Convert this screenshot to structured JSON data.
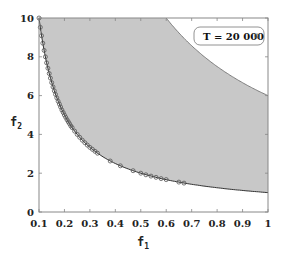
{
  "chart_data": {
    "type": "area",
    "title": "",
    "xlabel": "f",
    "xlabel_sub": "1",
    "ylabel": "f",
    "ylabel_sub": "2",
    "xlim": [
      0.1,
      1.0
    ],
    "ylim": [
      0,
      10
    ],
    "x_ticks": [
      "0.1",
      "0.2",
      "0.3",
      "0.4",
      "0.5",
      "0.6",
      "0.7",
      "0.8",
      "0.9",
      "1"
    ],
    "y_ticks": [
      "0",
      "2",
      "4",
      "6",
      "8",
      "10"
    ],
    "grid": false,
    "legend_position": "upper right",
    "shaded_region": {
      "description": "feasible region between lower and upper bound curves",
      "fill_color": "#c8c8c8",
      "lower_curve": {
        "formula": "f2 = 1/f1",
        "x": [
          0.1,
          0.15,
          0.2,
          0.3,
          0.4,
          0.5,
          0.6,
          0.7,
          0.8,
          0.9,
          1.0
        ],
        "y": [
          10,
          6.67,
          5.0,
          3.33,
          2.5,
          2.0,
          1.67,
          1.43,
          1.25,
          1.11,
          1.0
        ]
      },
      "upper_curve": {
        "formula": "f2 = 6/f1",
        "x": [
          0.6,
          0.7,
          0.8,
          0.9,
          1.0
        ],
        "y": [
          10,
          8.57,
          7.5,
          6.67,
          6.0
        ]
      }
    },
    "series": [
      {
        "name": "T = 20 000",
        "marker": "circle",
        "color": "#555555",
        "x": [
          0.1,
          0.105,
          0.11,
          0.115,
          0.12,
          0.125,
          0.13,
          0.135,
          0.14,
          0.145,
          0.15,
          0.155,
          0.16,
          0.165,
          0.17,
          0.175,
          0.18,
          0.185,
          0.19,
          0.195,
          0.2,
          0.205,
          0.21,
          0.215,
          0.22,
          0.225,
          0.23,
          0.24,
          0.25,
          0.26,
          0.27,
          0.28,
          0.29,
          0.3,
          0.31,
          0.32,
          0.33,
          0.38,
          0.42,
          0.47,
          0.5,
          0.52,
          0.54,
          0.56,
          0.58,
          0.6,
          0.65,
          0.67
        ],
        "y": [
          10.0,
          9.52,
          9.09,
          8.7,
          8.33,
          8.0,
          7.69,
          7.41,
          7.14,
          6.9,
          6.67,
          6.45,
          6.25,
          6.06,
          5.88,
          5.71,
          5.56,
          5.41,
          5.26,
          5.13,
          5.0,
          4.88,
          4.76,
          4.65,
          4.55,
          4.44,
          4.35,
          4.17,
          4.0,
          3.85,
          3.7,
          3.57,
          3.45,
          3.33,
          3.23,
          3.13,
          3.03,
          2.63,
          2.38,
          2.13,
          2.0,
          1.92,
          1.85,
          1.79,
          1.72,
          1.67,
          1.54,
          1.49
        ]
      }
    ]
  },
  "legend": {
    "label": "T = 20 000"
  },
  "axes": {
    "x_label": "f",
    "x_label_sub": "1",
    "y_label": "f",
    "y_label_sub": "2"
  }
}
